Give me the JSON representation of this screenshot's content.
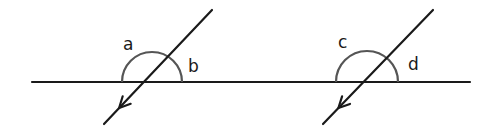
{
  "diagram": {
    "colors": {
      "line": "#1a1a1a",
      "arc": "#555555",
      "background": "#ffffff"
    },
    "base_line": {
      "x1": 32,
      "y1": 82,
      "x2": 470,
      "y2": 82
    },
    "figures": [
      {
        "transversal": {
          "x1": 212,
          "y1": 10,
          "x2": 104,
          "y2": 124
        },
        "arc": {
          "cx": 152,
          "cy": 82,
          "r": 30
        },
        "labels": [
          {
            "text": "a",
            "x": 123,
            "y": 50
          },
          {
            "text": "b",
            "x": 188,
            "y": 72
          }
        ]
      },
      {
        "transversal": {
          "x1": 433,
          "y1": 10,
          "x2": 323,
          "y2": 124
        },
        "arc": {
          "cx": 367,
          "cy": 82,
          "r": 31
        },
        "labels": [
          {
            "text": "c",
            "x": 338,
            "y": 48
          },
          {
            "text": "d",
            "x": 408,
            "y": 70
          }
        ]
      }
    ]
  }
}
